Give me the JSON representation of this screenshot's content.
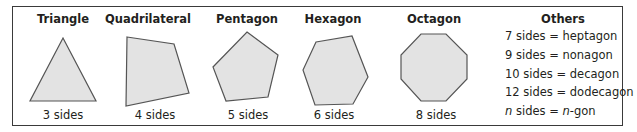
{
  "polygons": [
    {
      "name": "Triangle",
      "sides_label": "3 sides",
      "cx": 63,
      "points": "63,38 96,101 30,101"
    },
    {
      "name": "Quadrilateral",
      "sides_label": "4 sides",
      "cx": 148,
      "points": "127,37 174,44 189,93 126,106"
    },
    {
      "name": "Pentagon",
      "sides_label": "5 sides",
      "cx": 247,
      "points": "247,32 278,55 268,97 226,101 213,67"
    },
    {
      "name": "Hexagon",
      "sides_label": "6 sides",
      "cx": 333,
      "points": "316,42 352,36 368,77 353,104 315,105 303,70"
    },
    {
      "name": "Octagon",
      "sides_label": "8 sides",
      "cx": 434,
      "points": "421,34 446,34 467,55 467,79 446,101 421,101 401,79 401,55"
    }
  ],
  "others": {
    "title": "Others",
    "items": [
      {
        "count": "7",
        "label_mid": " sides = ",
        "name": "heptagon"
      },
      {
        "count": "9",
        "label_mid": " sides = ",
        "name": "nonagon"
      },
      {
        "count": "10",
        "label_mid": " sides = ",
        "name": "decagon"
      },
      {
        "count": "12",
        "label_mid": " sides = ",
        "name": "dodecagon"
      }
    ],
    "general": {
      "var": "n",
      "mid": " sides = ",
      "var2": "n",
      "suffix": "-gon"
    }
  },
  "colors": {
    "fill": "#e3e3e3",
    "stroke": "#555555",
    "border": "#3a3a3a"
  }
}
